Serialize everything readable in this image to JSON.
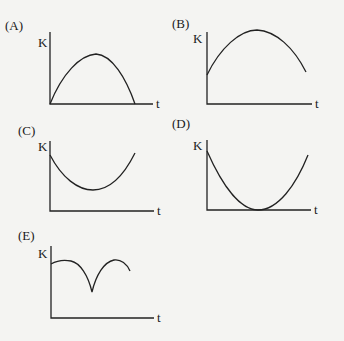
{
  "figure": {
    "panels": [
      {
        "label": "(A)",
        "y_axis": "K",
        "x_axis": "t",
        "shape": "concave-down arch starting and ending at zero"
      },
      {
        "label": "(B)",
        "y_axis": "K",
        "x_axis": "t",
        "shape": "concave-down arch starting above zero, peaking, then decreasing"
      },
      {
        "label": "(C)",
        "y_axis": "K",
        "x_axis": "t",
        "shape": "concave-up curve with nonzero minimum"
      },
      {
        "label": "(D)",
        "y_axis": "K",
        "x_axis": "t",
        "shape": "concave-up parabola with minimum touching zero"
      },
      {
        "label": "(E)",
        "y_axis": "K",
        "x_axis": "t",
        "shape": "two humps separated by a sharp cusp dip"
      }
    ]
  }
}
